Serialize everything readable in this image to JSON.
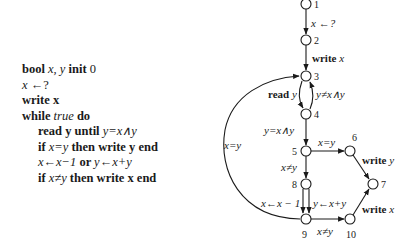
{
  "program": {
    "lines": [
      {
        "parts": [
          {
            "t": "bool ",
            "s": "kw"
          },
          {
            "t": "x, y",
            "s": "it"
          },
          {
            "t": " init ",
            "s": "kw"
          },
          {
            "t": "0",
            "s": ""
          }
        ]
      },
      {
        "parts": [
          {
            "t": "x",
            "s": "it"
          },
          {
            "t": " ←?",
            "s": ""
          }
        ]
      },
      {
        "parts": [
          {
            "t": "write x",
            "s": "kw"
          }
        ]
      },
      {
        "parts": [
          {
            "t": "while ",
            "s": "kw"
          },
          {
            "t": "true",
            "s": "it"
          },
          {
            "t": " do",
            "s": "kw"
          }
        ]
      },
      {
        "indent": true,
        "parts": [
          {
            "t": "read y until ",
            "s": "kw"
          },
          {
            "t": "y=x∧y",
            "s": "it"
          }
        ]
      },
      {
        "indent": true,
        "parts": [
          {
            "t": "if ",
            "s": "kw"
          },
          {
            "t": "x=y",
            "s": "it"
          },
          {
            "t": " then write y end",
            "s": "kw"
          }
        ]
      },
      {
        "indent": true,
        "parts": [
          {
            "t": "x←x−1",
            "s": "it"
          },
          {
            "t": " or ",
            "s": "kw"
          },
          {
            "t": "y←x+y",
            "s": "it"
          }
        ]
      },
      {
        "indent": true,
        "parts": [
          {
            "t": "if ",
            "s": "kw"
          },
          {
            "t": "x≠y",
            "s": "it"
          },
          {
            "t": " then write x end",
            "s": "kw"
          }
        ]
      }
    ]
  },
  "graph": {
    "nodes": [
      {
        "id": "1",
        "x": 306,
        "y": 4,
        "label": "1",
        "lx": 314,
        "ly": 8
      },
      {
        "id": "2",
        "x": 306,
        "y": 40,
        "label": "2",
        "lx": 314,
        "ly": 44
      },
      {
        "id": "3",
        "x": 306,
        "y": 76,
        "label": "3",
        "lx": 314,
        "ly": 80
      },
      {
        "id": "4",
        "x": 306,
        "y": 114,
        "label": "4",
        "lx": 314,
        "ly": 118
      },
      {
        "id": "5",
        "x": 306,
        "y": 151,
        "label": "5",
        "lx": 292,
        "ly": 155
      },
      {
        "id": "6",
        "x": 350,
        "y": 151,
        "label": "6",
        "lx": 352,
        "ly": 141
      },
      {
        "id": "7",
        "x": 373,
        "y": 184,
        "label": "7",
        "lx": 381,
        "ly": 188
      },
      {
        "id": "8",
        "x": 306,
        "y": 184,
        "label": "8",
        "lx": 292,
        "ly": 188
      },
      {
        "id": "9",
        "x": 306,
        "y": 219,
        "label": "9",
        "lx": 302,
        "ly": 238
      },
      {
        "id": "10",
        "x": 350,
        "y": 219,
        "label": "10",
        "lx": 346,
        "ly": 238
      }
    ],
    "edge_labels": {
      "e1_2": "x ←?",
      "e2_3": "write",
      "e2_3_var": "x",
      "e3_4": "read",
      "e3_4_var": "y",
      "e4_3": "y≠x∧y",
      "e4_5": "y=x∧y",
      "e5_6": "x=y",
      "e5_8": "x≠y",
      "e6_7": "write",
      "e6_7_var": "y",
      "e8_9a": "x←x − 1",
      "e8_9b": "y←x+y",
      "e9_10": "x≠y",
      "e10_7": "write",
      "e10_7_var": "x",
      "e9_3": "x=y"
    }
  }
}
